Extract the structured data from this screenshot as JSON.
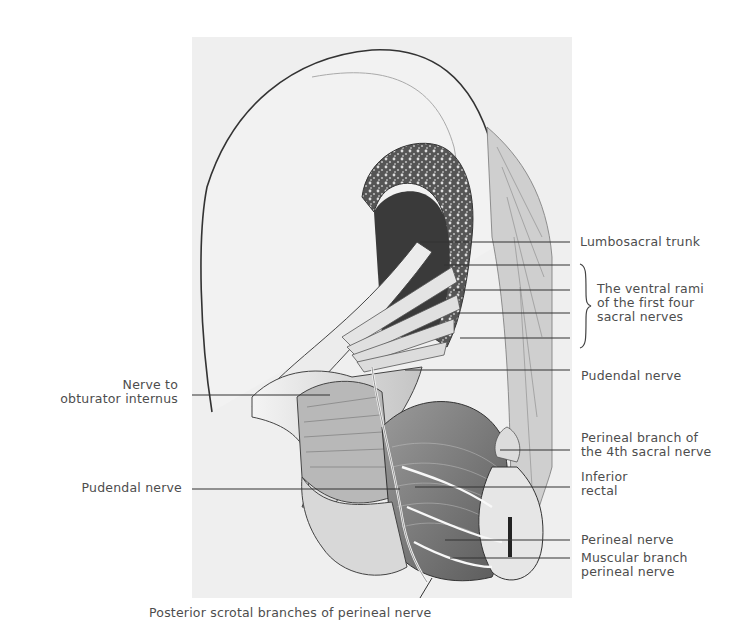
{
  "figure": {
    "background": "#efefef",
    "ink": "#3a3a3a"
  },
  "labels": {
    "right": [
      {
        "id": "lumbosacral-trunk",
        "lines": [
          "Lumbosacral trunk"
        ]
      },
      {
        "id": "ventral-rami",
        "lines": [
          "The ventral rami",
          "of the first four",
          "sacral nerves"
        ]
      },
      {
        "id": "pudendal-nerve-right",
        "lines": [
          "Pudendal nerve"
        ]
      },
      {
        "id": "perineal-branch-4th-sacral",
        "lines": [
          "Perineal branch of",
          "the 4th sacral nerve"
        ]
      },
      {
        "id": "inferior-rectal",
        "lines": [
          "Inferior",
          "rectal"
        ]
      },
      {
        "id": "perineal-nerve",
        "lines": [
          "Perineal nerve"
        ]
      },
      {
        "id": "muscular-branch",
        "lines": [
          "Muscular branch",
          "perineal nerve"
        ]
      }
    ],
    "left": [
      {
        "id": "nerve-to-obturator-internus",
        "lines": [
          "Nerve to",
          "obturator internus"
        ]
      },
      {
        "id": "pudendal-nerve-left",
        "lines": [
          "Pudendal nerve"
        ]
      }
    ],
    "bottom": {
      "id": "posterior-scrotal-branches",
      "text": "Posterior scrotal branches of perineal nerve"
    }
  }
}
